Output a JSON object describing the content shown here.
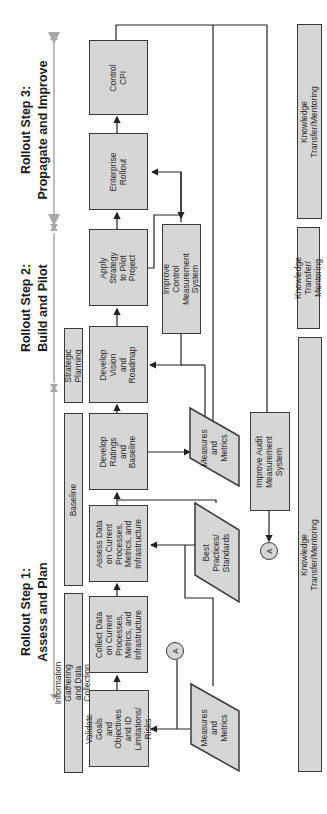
{
  "steps": [
    {
      "id": "step3",
      "label": "Rollout Step 3:\nPropagate and Improve"
    },
    {
      "id": "step2",
      "label": "Rollout Step 2:\nBuild and Pilot"
    },
    {
      "id": "step1",
      "label": "Rollout Step 1:\nAssess and Plan"
    }
  ],
  "phases": [
    {
      "label": "Strategic Planning"
    },
    {
      "label": "Baseline"
    },
    {
      "label": "Information Gathering and Data Collection"
    }
  ],
  "process": [
    {
      "label": "Control\nCPI"
    },
    {
      "label": "Enterprise\nRollout"
    },
    {
      "label": "Apply Strategy\nto Pilot Project"
    },
    {
      "label": "Develop\nVision and\nRoadmap"
    },
    {
      "label": "Develop Ratings\nand Baseline"
    },
    {
      "label": "Assess Data\non Current\nProcesses,\nMetrics, and\nInfrastructure"
    },
    {
      "label": "Collect Data\non Current\nProcesses,\nMetrics, and\nInfrastructure"
    },
    {
      "label": "Validate Goals\nand Objectives\nand ID Limitations/\nRisks"
    }
  ],
  "support": {
    "improve_control": "Improve Control\nMeasurement System",
    "improve_audit": "Improve Audit\nMeasurement System",
    "measures_upper": "Measures\nand\nMetrics",
    "best_practices": "Best\nPractices/\nStandards",
    "measures_lower": "Measures\nand\nMetrics",
    "connector_a_1": "A",
    "connector_a_2": "A"
  },
  "knowledge_transfer": [
    {
      "label": "Knowledge Transfer/Mentoring"
    },
    {
      "label": "Knowledge Transfer/\nMentoring"
    },
    {
      "label": "Knowledge Transfer/Mentoring"
    }
  ],
  "colors": {
    "box_fill": "#d6d6d6",
    "stroke": "#3a3a3a",
    "timeline": "#a8a8a8"
  }
}
